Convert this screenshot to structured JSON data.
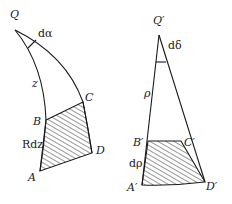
{
  "left_figure": {
    "labels": {
      "apex": "Q",
      "angle": "dα",
      "side": "z",
      "B": "B",
      "C": "C",
      "D": "D",
      "A": "A",
      "element": "Rdz"
    }
  },
  "right_figure": {
    "labels": {
      "apex": "Q′",
      "angle": "dδ",
      "side": "ρ",
      "B": "B′",
      "C": "C′",
      "D": "D′",
      "A": "A′",
      "element": "dρ"
    }
  },
  "colors": {
    "line": "#1a1a1a",
    "background": "#ffffff"
  }
}
